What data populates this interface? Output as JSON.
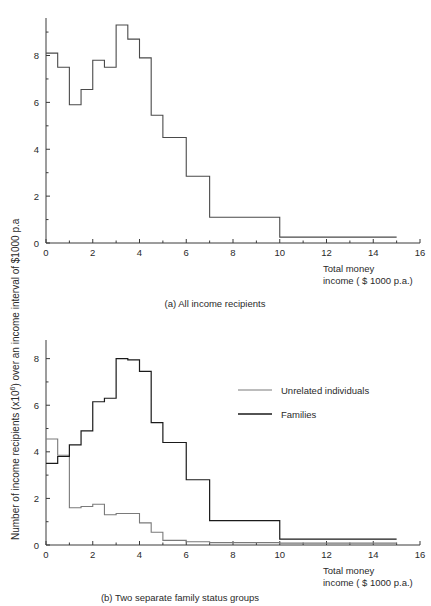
{
  "figure": {
    "y_axis_label_parts": {
      "p1": "Number of income recipients (x10",
      "sup": "6",
      "p2": ") over an income interval of $1000 p.a"
    },
    "y_axis_label_full": "Number of income recipients (x10^6) over an income interval of $1000 p.a"
  },
  "panel_a": {
    "caption": "(a) All income recipients",
    "x_axis_title_line1": "Total  money",
    "x_axis_title_line2": "income ( $ 1000  p.a.)",
    "x_ticks": [
      "0",
      "2",
      "4",
      "6",
      "8",
      "10",
      "12",
      "14",
      "16"
    ],
    "y_ticks": [
      "0",
      "2",
      "4",
      "6",
      "8"
    ]
  },
  "panel_b": {
    "caption": "(b) Two separate family status groups",
    "x_axis_title_line1": "Total  money",
    "x_axis_title_line2": "income ( $ 1000  p.a.)",
    "x_ticks": [
      "0",
      "2",
      "4",
      "6",
      "8",
      "10",
      "12",
      "14",
      "16"
    ],
    "y_ticks": [
      "0",
      "2",
      "4",
      "6",
      "8"
    ],
    "legend": [
      {
        "label": "Unrelated individuals",
        "color": "#7a7a7a"
      },
      {
        "label": "Families",
        "color": "#1a1a1a"
      }
    ]
  },
  "chart_data": [
    {
      "type": "bar",
      "id": "panel-a-histogram",
      "title": "(a) All income recipients",
      "xlabel": "Total money income ( $ 1000 p.a.)",
      "ylabel": "Number of income recipients (x10^6) over an income interval of $1000 p.a",
      "xlim": [
        0,
        16
      ],
      "ylim": [
        0,
        9.6
      ],
      "grid": false,
      "legend": null,
      "xtick_values": [
        0,
        2,
        4,
        6,
        8,
        10,
        12,
        14,
        16
      ],
      "ytick_values": [
        0,
        2,
        4,
        6,
        8
      ],
      "note": "Step (histogram outline) plot. Bin edges are uneven: 0.5-wide bins to 6.0, then 6-7, 7-10, 10-15.",
      "bins": [
        {
          "x0": 0.0,
          "x1": 0.5,
          "value": 8.1
        },
        {
          "x0": 0.5,
          "x1": 1.0,
          "value": 7.5
        },
        {
          "x0": 1.0,
          "x1": 1.5,
          "value": 5.9
        },
        {
          "x0": 1.5,
          "x1": 2.0,
          "value": 6.55
        },
        {
          "x0": 2.0,
          "x1": 2.5,
          "value": 7.8
        },
        {
          "x0": 2.5,
          "x1": 3.0,
          "value": 7.5
        },
        {
          "x0": 3.0,
          "x1": 3.5,
          "value": 9.3
        },
        {
          "x0": 3.5,
          "x1": 4.0,
          "value": 8.7
        },
        {
          "x0": 4.0,
          "x1": 4.5,
          "value": 7.9
        },
        {
          "x0": 4.5,
          "x1": 5.0,
          "value": 5.45
        },
        {
          "x0": 5.0,
          "x1": 6.0,
          "value": 4.5
        },
        {
          "x0": 6.0,
          "x1": 7.0,
          "value": 2.85
        },
        {
          "x0": 7.0,
          "x1": 10.0,
          "value": 1.1
        },
        {
          "x0": 10.0,
          "x1": 15.0,
          "value": 0.25
        }
      ]
    },
    {
      "type": "bar",
      "id": "panel-b-histogram",
      "title": "(b) Two separate family status groups",
      "xlabel": "Total money income ( $ 1000 p.a.)",
      "ylabel": "Number of income recipients (x10^6) over an income interval of $1000 p.a",
      "xlim": [
        0,
        16
      ],
      "ylim": [
        0,
        8.8
      ],
      "grid": false,
      "legend_position": "upper-right",
      "xtick_values": [
        0,
        2,
        4,
        6,
        8,
        10,
        12,
        14,
        16
      ],
      "ytick_values": [
        0,
        2,
        4,
        6,
        8
      ],
      "note": "Two overlaid step (histogram outline) plots.",
      "series": [
        {
          "name": "Unrelated individuals",
          "color": "#7a7a7a",
          "bins": [
            {
              "x0": 0.0,
              "x1": 0.5,
              "value": 4.55
            },
            {
              "x0": 0.5,
              "x1": 1.0,
              "value": 3.85
            },
            {
              "x0": 1.0,
              "x1": 1.5,
              "value": 1.6
            },
            {
              "x0": 1.5,
              "x1": 2.0,
              "value": 1.65
            },
            {
              "x0": 2.0,
              "x1": 2.5,
              "value": 1.75
            },
            {
              "x0": 2.5,
              "x1": 3.0,
              "value": 1.3
            },
            {
              "x0": 3.0,
              "x1": 3.5,
              "value": 1.35
            },
            {
              "x0": 3.5,
              "x1": 4.0,
              "value": 1.35
            },
            {
              "x0": 4.0,
              "x1": 4.5,
              "value": 0.95
            },
            {
              "x0": 4.5,
              "x1": 5.0,
              "value": 0.55
            },
            {
              "x0": 5.0,
              "x1": 6.0,
              "value": 0.2
            },
            {
              "x0": 6.0,
              "x1": 7.0,
              "value": 0.14
            },
            {
              "x0": 7.0,
              "x1": 10.0,
              "value": 0.1
            },
            {
              "x0": 10.0,
              "x1": 15.0,
              "value": 0.08
            }
          ]
        },
        {
          "name": "Families",
          "color": "#1a1a1a",
          "bins": [
            {
              "x0": 0.0,
              "x1": 0.5,
              "value": 3.5
            },
            {
              "x0": 0.5,
              "x1": 1.0,
              "value": 3.8
            },
            {
              "x0": 1.0,
              "x1": 1.5,
              "value": 4.3
            },
            {
              "x0": 1.5,
              "x1": 2.0,
              "value": 4.9
            },
            {
              "x0": 2.0,
              "x1": 2.5,
              "value": 6.15
            },
            {
              "x0": 2.5,
              "x1": 3.0,
              "value": 6.3
            },
            {
              "x0": 3.0,
              "x1": 3.5,
              "value": 8.0
            },
            {
              "x0": 3.5,
              "x1": 4.0,
              "value": 7.95
            },
            {
              "x0": 4.0,
              "x1": 4.5,
              "value": 7.45
            },
            {
              "x0": 4.5,
              "x1": 5.0,
              "value": 5.25
            },
            {
              "x0": 5.0,
              "x1": 6.0,
              "value": 4.4
            },
            {
              "x0": 6.0,
              "x1": 7.0,
              "value": 2.8
            },
            {
              "x0": 7.0,
              "x1": 10.0,
              "value": 1.05
            },
            {
              "x0": 10.0,
              "x1": 15.0,
              "value": 0.25
            }
          ]
        }
      ]
    }
  ]
}
